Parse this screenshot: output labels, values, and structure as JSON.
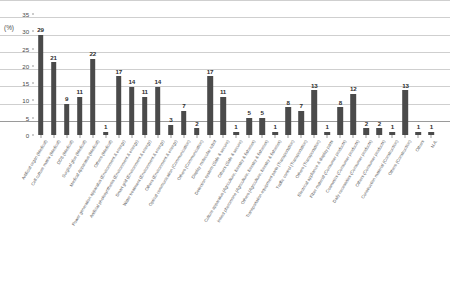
{
  "chart_data": {
    "type": "bar",
    "title": "",
    "xlabel": "",
    "ylabel": "(%)",
    "ylim": [
      0,
      35
    ],
    "y_ticks": [
      0,
      5,
      10,
      15,
      20,
      25,
      30,
      35
    ],
    "grid": true,
    "legend": "none",
    "bar_color": "#4a4a4a",
    "categories": [
      "Artificial organ  (Medical)",
      "Cell culture matrix  (Medical)",
      "DDS  (Medical)",
      "Surgical glue  (Medical)",
      "Medical Apparatus  (Medical)",
      "Others  (Medical)",
      "Power generation apparatus  (Environment & energy)",
      "Artificial photosynthesis  (Environment & energy)",
      "Smart grid  (Environment & energy)",
      "Water treatment  (Environment & energy)",
      "Others  (Environment & energy)",
      "Optical communication  (Communication)",
      "Others  (Communication)",
      "Display molecular robot",
      "Detection system  (Safe & secure)",
      "Others  (Safe & secure)",
      "Culture apparatus  (Agriculture, forestry & fisheries)",
      "Insect pheromone  (Agriculture, forestry & fisheries)",
      "Others  (Agriculture, forestry & fisheries)",
      "Transportation equipment parts  (Transportation)",
      "Traffic control  (Transportation)",
      "Others  (Transportation)",
      "Electrical appliance & display parts",
      "Fiber material  (Consumer products)",
      "Cosmetics  (Consumer products)",
      "Daily necessities  (Consumer products)",
      "Others  (Consumer products)",
      "Construction material  (Construction)",
      "Others  (Construction)",
      "Others",
      "N.A."
    ],
    "values": [
      29,
      21,
      9,
      11,
      22,
      1,
      17,
      14,
      11,
      14,
      3,
      7,
      2,
      17,
      11,
      1,
      5,
      5,
      1,
      8,
      7,
      13,
      1,
      8,
      12,
      2,
      2,
      1,
      13,
      1,
      1
    ],
    "value_labels": [
      "29",
      "21",
      "9",
      "11",
      "22",
      "1",
      "17",
      "14",
      "11",
      "14",
      "3",
      "7",
      "2",
      "17",
      "11",
      "1",
      "5",
      "5",
      "1",
      "8",
      "7",
      "13",
      "1",
      "8",
      "12",
      "2",
      "2",
      "1",
      "13",
      "1",
      "1"
    ]
  }
}
